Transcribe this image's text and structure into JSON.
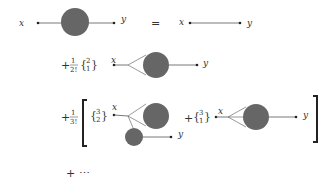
{
  "equation": {
    "lhs": {
      "x_label": "x",
      "y_label": "y",
      "description": "full propagator: line with shaded blob"
    },
    "equals": "=",
    "rhs_term0": {
      "x_label": "x",
      "y_label": "y",
      "description": "bare propagator line"
    },
    "term1": {
      "sign": "+",
      "prefactor_num": "1",
      "prefactor_den": "2!",
      "stirling_top": "2",
      "stirling_bottom": "1",
      "x_label": "x",
      "y_label": "y"
    },
    "term2": {
      "sign": "+",
      "prefactor_num": "1",
      "prefactor_den": "3!",
      "part_a": {
        "stirling_top": "3",
        "stirling_bottom": "2",
        "x_label": "x",
        "y_label": "y"
      },
      "part_b": {
        "sign": "+",
        "stirling_top": "3",
        "stirling_bottom": "1",
        "x_label": "x",
        "y_label": "y"
      }
    },
    "continuation": "+ ⋯"
  },
  "colors": {
    "blob": "#666666",
    "line": "#555555",
    "text": "#333333"
  }
}
